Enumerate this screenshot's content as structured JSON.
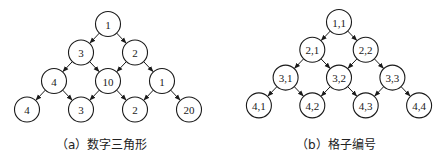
{
  "panels": [
    {
      "id": "a",
      "caption": "（a）数字三角形",
      "caption_x": 56,
      "origin": {
        "x": 108,
        "y": 24
      },
      "dx": 27,
      "dy": 28.5,
      "radius": 12.5,
      "rows": [
        [
          "1"
        ],
        [
          "3",
          "2"
        ],
        [
          "4",
          "10",
          "1"
        ],
        [
          "4",
          "3",
          "2",
          "20"
        ]
      ]
    },
    {
      "id": "b",
      "caption": "（b）格子编号",
      "caption_x": 296,
      "origin": {
        "x": 339,
        "y": 22
      },
      "dx": 26.7,
      "dy": 27.8,
      "radius": 12.5,
      "rows": [
        [
          "1,1"
        ],
        [
          "2,1",
          "2,2"
        ],
        [
          "3,1",
          "3,2",
          "3,3"
        ],
        [
          "4,1",
          "4,2",
          "4,3",
          "4,4"
        ]
      ]
    }
  ],
  "edge_style": "arrow",
  "colors": {
    "stroke": "#1a1a1a",
    "fill": "#ffffff",
    "background": "#ffffff"
  }
}
